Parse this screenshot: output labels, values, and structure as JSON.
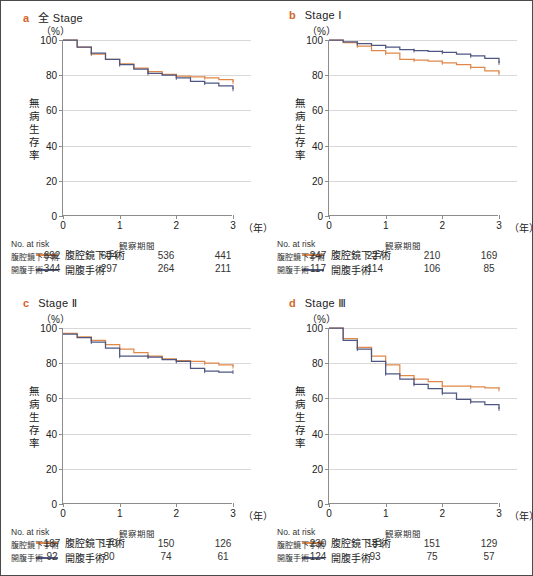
{
  "figure": {
    "axis": {
      "y_ticks": [
        "0",
        "20",
        "40",
        "60",
        "80",
        "100"
      ],
      "x_ticks": [
        "0",
        "1",
        "2",
        "3"
      ],
      "x_unit": "（年）",
      "y_unit": "（%）",
      "y_label_chars": [
        "無",
        "病",
        "生",
        "存",
        "率"
      ],
      "ylim": [
        0,
        100
      ],
      "xlim": [
        0,
        3
      ]
    },
    "legend": {
      "lap_label": "腹腔鏡下手術",
      "open_label": "開腹手術",
      "lap_color": "#e0884a",
      "open_color": "#4e5782"
    },
    "risk": {
      "title": "No. at risk",
      "period": "観察期間",
      "lap_label": "腹腔鏡下手術",
      "open_label": "開腹手術"
    }
  },
  "panels": [
    {
      "letter": "a",
      "title": "全 Stage",
      "risk_lap": [
        "692",
        "604",
        "536",
        "441"
      ],
      "risk_open": [
        "344",
        "297",
        "264",
        "211"
      ]
    },
    {
      "letter": "b",
      "title": "Stage Ⅰ",
      "risk_lap": [
        "247",
        "227",
        "210",
        "169"
      ],
      "risk_open": [
        "117",
        "114",
        "106",
        "85"
      ]
    },
    {
      "letter": "c",
      "title": "Stage Ⅱ",
      "risk_lap": [
        "187",
        "170",
        "150",
        "126"
      ],
      "risk_open": [
        "92",
        "80",
        "74",
        "61"
      ]
    },
    {
      "letter": "d",
      "title": "Stage Ⅲ",
      "risk_lap": [
        "230",
        "181",
        "151",
        "129"
      ],
      "risk_open": [
        "124",
        "93",
        "75",
        "57"
      ]
    }
  ],
  "chart_data": [
    {
      "type": "line",
      "title": "全 Stage",
      "xlabel": "観察期間（年）",
      "ylabel": "無病生存率（%）",
      "xlim": [
        0,
        3
      ],
      "ylim": [
        0,
        100
      ],
      "grid": true,
      "legend_position": "bottom-left",
      "series": [
        {
          "name": "腹腔鏡下手術",
          "color": "#e0884a",
          "x": [
            0,
            0.25,
            0.5,
            0.75,
            1.0,
            1.25,
            1.5,
            1.75,
            2.0,
            2.25,
            2.5,
            2.75,
            3.0
          ],
          "values": [
            100,
            96,
            92,
            89,
            86.5,
            84,
            82,
            80.5,
            79.5,
            79,
            78.5,
            77.5,
            76
          ]
        },
        {
          "name": "開腹手術",
          "color": "#4e5782",
          "x": [
            0,
            0.25,
            0.5,
            0.75,
            1.0,
            1.25,
            1.5,
            1.75,
            2.0,
            2.25,
            2.5,
            2.75,
            3.0
          ],
          "values": [
            100,
            96,
            92.5,
            89,
            86,
            83.5,
            81,
            80,
            78.5,
            76.5,
            75.5,
            74,
            72
          ]
        }
      ]
    },
    {
      "type": "line",
      "title": "Stage Ⅰ",
      "xlabel": "観察期間（年）",
      "ylabel": "無病生存率（%）",
      "xlim": [
        0,
        3
      ],
      "ylim": [
        0,
        100
      ],
      "grid": true,
      "legend_position": "bottom-left",
      "series": [
        {
          "name": "腹腔鏡下手術",
          "color": "#e0884a",
          "x": [
            0,
            0.25,
            0.5,
            0.75,
            1.0,
            1.25,
            1.5,
            1.75,
            2.0,
            2.25,
            2.5,
            2.75,
            3.0
          ],
          "values": [
            100,
            98.5,
            96.5,
            94,
            92.5,
            89,
            88.5,
            88,
            87,
            86,
            84.5,
            82.5,
            81
          ]
        },
        {
          "name": "開腹手術",
          "color": "#4e5782",
          "x": [
            0,
            0.25,
            0.5,
            0.75,
            1.0,
            1.25,
            1.5,
            1.75,
            2.0,
            2.25,
            2.5,
            2.75,
            3.0
          ],
          "values": [
            100,
            99,
            98,
            97,
            96,
            94.5,
            94,
            93.5,
            93,
            92,
            91,
            89.5,
            87
          ]
        }
      ]
    },
    {
      "type": "line",
      "title": "Stage Ⅱ",
      "xlabel": "観察期間（年）",
      "ylabel": "無病生存率（%）",
      "xlim": [
        0,
        3
      ],
      "ylim": [
        0,
        100
      ],
      "grid": true,
      "legend_position": "bottom-left",
      "series": [
        {
          "name": "腹腔鏡下手術",
          "color": "#e0884a",
          "x": [
            0,
            0.25,
            0.5,
            0.75,
            1.0,
            1.25,
            1.5,
            1.75,
            2.0,
            2.25,
            2.5,
            2.75,
            3.0
          ],
          "values": [
            97,
            95,
            93,
            90.5,
            88,
            86,
            84,
            82.5,
            81.5,
            81,
            80,
            79,
            78
          ]
        },
        {
          "name": "開腹手術",
          "color": "#4e5782",
          "x": [
            0,
            0.25,
            0.5,
            0.75,
            1.0,
            1.25,
            1.5,
            1.75,
            2.0,
            2.25,
            2.5,
            2.75,
            3.0
          ],
          "values": [
            96.5,
            94.5,
            92,
            88.5,
            84,
            84,
            83.5,
            82,
            81,
            77,
            75.5,
            75,
            75
          ]
        }
      ]
    },
    {
      "type": "line",
      "title": "Stage Ⅲ",
      "xlabel": "観察期間（年）",
      "ylabel": "無病生存率（%）",
      "xlim": [
        0,
        3
      ],
      "ylim": [
        0,
        100
      ],
      "grid": true,
      "legend_position": "bottom-left",
      "series": [
        {
          "name": "腹腔鏡下手術",
          "color": "#e0884a",
          "x": [
            0,
            0.25,
            0.5,
            0.75,
            1.0,
            1.25,
            1.5,
            1.75,
            2.0,
            2.25,
            2.5,
            2.75,
            3.0
          ],
          "values": [
            100,
            94,
            89,
            84,
            79,
            73,
            71,
            69.5,
            67,
            67,
            66.5,
            66,
            65
          ]
        },
        {
          "name": "開腹手術",
          "color": "#4e5782",
          "x": [
            0,
            0.25,
            0.5,
            0.75,
            1.0,
            1.25,
            1.5,
            1.75,
            2.0,
            2.25,
            2.5,
            2.75,
            3.0
          ],
          "values": [
            100,
            93,
            88,
            81,
            74,
            71,
            68,
            65.5,
            63,
            59.5,
            58,
            56.5,
            54
          ]
        }
      ]
    }
  ]
}
